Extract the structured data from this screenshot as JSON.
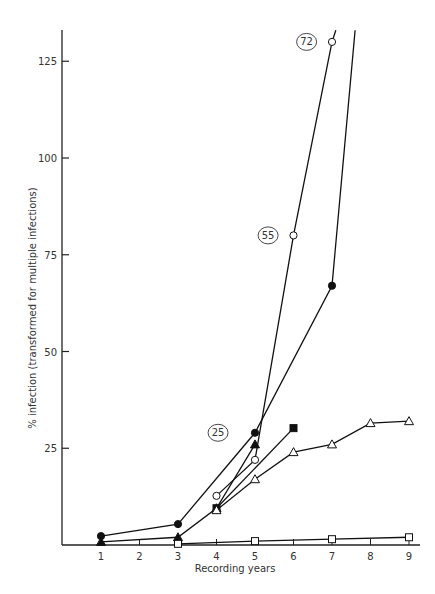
{
  "chart_data": {
    "type": "line",
    "title": "",
    "xlabel": "Recording years",
    "ylabel": "% infection (transformed for multiple infections)",
    "x_ticks": [
      1,
      2,
      3,
      4,
      5,
      6,
      7,
      8,
      9
    ],
    "y_ticks": [
      25,
      50,
      75,
      100,
      125
    ],
    "xlim": [
      0,
      9.3
    ],
    "ylim": [
      0,
      133
    ],
    "grid": false,
    "legend": "none",
    "series": [
      {
        "name": "filled-circle",
        "marker": "circle-filled",
        "points": [
          [
            1,
            2.3
          ],
          [
            3,
            5.4
          ],
          [
            5,
            29
          ],
          [
            7,
            67
          ]
        ],
        "continues_to": [
          7.6,
          133
        ]
      },
      {
        "name": "filled-triangle",
        "marker": "triangle-filled",
        "points": [
          [
            1,
            0.8
          ],
          [
            3,
            2
          ],
          [
            4,
            9.5
          ],
          [
            5,
            26
          ]
        ]
      },
      {
        "name": "open-circle",
        "marker": "circle-open",
        "points": [
          [
            4,
            12.7
          ],
          [
            5,
            22
          ],
          [
            6,
            80
          ],
          [
            7,
            130
          ]
        ],
        "continues_to": [
          7.1,
          133
        ]
      },
      {
        "name": "filled-square",
        "marker": "square-filled",
        "points": [
          [
            4,
            9.5
          ],
          [
            6,
            30.2
          ]
        ]
      },
      {
        "name": "open-triangle",
        "marker": "triangle-open",
        "points": [
          [
            4,
            9
          ],
          [
            5,
            17
          ],
          [
            6,
            24
          ],
          [
            7,
            26
          ],
          [
            8,
            31.5
          ],
          [
            9,
            32
          ]
        ]
      },
      {
        "name": "open-square",
        "marker": "square-open",
        "points": [
          [
            3,
            0.3
          ],
          [
            5,
            1
          ],
          [
            7,
            1.5
          ],
          [
            9,
            2
          ]
        ]
      }
    ],
    "annotations": [
      {
        "text": "25",
        "x": 4.3,
        "y": 29,
        "style": "circled"
      },
      {
        "text": "55",
        "x": 5.6,
        "y": 80,
        "style": "circled"
      },
      {
        "text": "72",
        "x": 6.6,
        "y": 130,
        "style": "circled"
      }
    ]
  }
}
